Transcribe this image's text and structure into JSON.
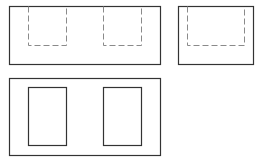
{
  "diagram": {
    "colors": {
      "background": "#ffffff",
      "visible_line": "#333333",
      "hidden_line": "#8a8a8a"
    },
    "views": [
      {
        "name": "front-view",
        "outline": {
          "x": 9,
          "y": 6,
          "w": 151,
          "h": 58
        },
        "hidden_rects": [
          {
            "x": 28,
            "y": 6,
            "w": 38,
            "h": 39
          },
          {
            "x": 103,
            "y": 6,
            "w": 38,
            "h": 39
          }
        ]
      },
      {
        "name": "side-view",
        "outline": {
          "x": 178,
          "y": 6,
          "w": 75,
          "h": 58
        },
        "hidden_rects": [
          {
            "x": 187,
            "y": 6,
            "w": 57,
            "h": 39
          }
        ]
      },
      {
        "name": "top-view",
        "outline": {
          "x": 9,
          "y": 78,
          "w": 151,
          "h": 77
        },
        "visible_rects": [
          {
            "x": 28,
            "y": 87,
            "w": 38,
            "h": 58
          },
          {
            "x": 103,
            "y": 87,
            "w": 38,
            "h": 58
          }
        ]
      }
    ]
  }
}
